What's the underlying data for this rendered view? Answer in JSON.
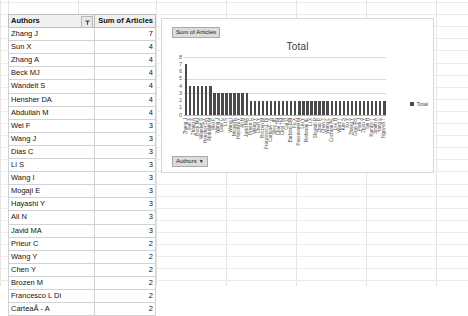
{
  "table": {
    "columns": [
      "Authors",
      "Sum of Articles"
    ],
    "filter_icon": "filter-sort-icon",
    "rows": [
      {
        "author": "Zhang J",
        "value": "7"
      },
      {
        "author": "Sun X",
        "value": "4"
      },
      {
        "author": "Zhang A",
        "value": "4"
      },
      {
        "author": "Beck MJ",
        "value": "4"
      },
      {
        "author": "Wandelt S",
        "value": "4"
      },
      {
        "author": "Hensher DA",
        "value": "4"
      },
      {
        "author": "Abdullah M",
        "value": "4"
      },
      {
        "author": "Wei F",
        "value": "3"
      },
      {
        "author": "Wang J",
        "value": "3"
      },
      {
        "author": "Dias C",
        "value": "3"
      },
      {
        "author": "Li S",
        "value": "3"
      },
      {
        "author": "Wang I",
        "value": "3"
      },
      {
        "author": "Mogaji E",
        "value": "3"
      },
      {
        "author": "Hayashi Y",
        "value": "3"
      },
      {
        "author": "Ali N",
        "value": "3"
      },
      {
        "author": "Javid MA",
        "value": "3"
      },
      {
        "author": "Prieur C",
        "value": "2"
      },
      {
        "author": "Wang Y",
        "value": "2"
      },
      {
        "author": "Chen Y",
        "value": "2"
      },
      {
        "author": "Brozen M",
        "value": "2"
      },
      {
        "author": "Francesco L Di",
        "value": "2"
      },
      {
        "author": "CarteaÃ - A",
        "value": "2"
      }
    ]
  },
  "chart": {
    "title": "Total",
    "value_field_button": "Sum of Articles",
    "axis_field_button": "Authors",
    "field_button_caret": "▼",
    "legend": [
      {
        "name": "Total",
        "color": "#4a4a4a"
      }
    ]
  },
  "chart_data": {
    "type": "bar",
    "title": "Total",
    "xlabel": "",
    "ylabel": "",
    "ylim": [
      0,
      8
    ],
    "yticks": [
      0,
      1,
      2,
      3,
      4,
      5,
      6,
      7,
      8
    ],
    "grid": true,
    "legend_position": "right",
    "series": [
      {
        "name": "Total",
        "color": "#4a4a4a",
        "values": [
          7,
          4,
          4,
          4,
          4,
          4,
          4,
          3,
          3,
          3,
          3,
          3,
          3,
          3,
          3,
          3,
          2,
          2,
          2,
          2,
          2,
          2,
          2,
          2,
          2,
          2,
          2,
          2,
          2,
          2,
          2,
          2,
          2,
          2,
          2,
          2,
          2,
          2,
          2,
          2,
          2,
          2,
          2,
          2,
          2,
          2,
          2,
          2,
          2,
          2
        ]
      }
    ],
    "categories": [
      "Zhang J",
      "Sun X",
      "Zhang A",
      "Beck MJ",
      "Wandelt S",
      "Hensher DA",
      "Abdullah M",
      "Wei F",
      "Wang J",
      "Dias C",
      "Li S",
      "Wang I",
      "Mogaji E",
      "Hayashi Y",
      "Ali N",
      "Javid MA",
      "Prieur C",
      "Wang Y",
      "Chen Y",
      "Brozen M",
      "Francesco L Di",
      "CarteaÃ - A",
      "Sileo JB",
      "Chai TM",
      "Choi TM",
      "Cui Q",
      "Barbieri DM",
      "Fu X",
      "Passavanti M",
      "Liu Y",
      "Rothman IE",
      "Li X",
      "Shortall R",
      "Zhao P",
      "Chen Z",
      "Wang L",
      "Cochran AL",
      "Lee H",
      "Ward T",
      "Kim S",
      "Xu Y",
      "Zhang Y",
      "Gray RS",
      "Park J",
      "Zhou Y",
      "Tan H",
      "Kumbo T",
      "Smith A",
      "Yang L",
      "Nguyen T"
    ]
  }
}
